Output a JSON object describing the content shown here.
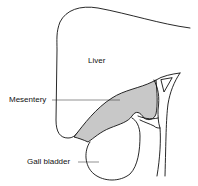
{
  "diagram": {
    "labels": {
      "liver": "Liver",
      "mesentery": "Mesentery",
      "gall_bladder": "Gall bladder"
    },
    "colors": {
      "outline": "#111111",
      "mesentery_fill": "#c8c8c8",
      "background": "#ffffff"
    }
  }
}
